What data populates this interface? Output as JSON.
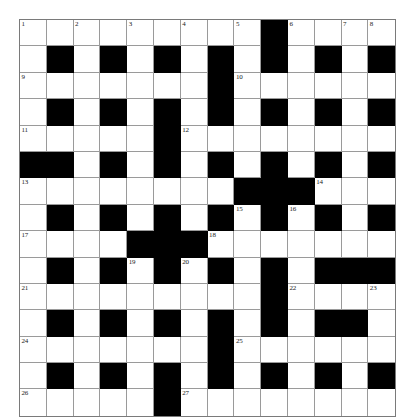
{
  "puzzle": {
    "type": "crossword-grid",
    "rows": 14,
    "cols": 14,
    "colors": {
      "block": "#000000",
      "cell": "#ffffff",
      "gridline": "#9a9a9a",
      "border": "#7a7a7a",
      "number": "#1a1a1a"
    },
    "legend": {
      "white": "open letter cell",
      "black": "blocked cell"
    },
    "clue_numbers_present": [
      1,
      2,
      3,
      4,
      5,
      6,
      7,
      8,
      9,
      10,
      11,
      12,
      13,
      14,
      15,
      16,
      17,
      18,
      19,
      20,
      21,
      22,
      23,
      24,
      25,
      26,
      27
    ],
    "grid": [
      [
        {
          "t": "w",
          "n": "1"
        },
        {
          "t": "w"
        },
        {
          "t": "w",
          "n": "2"
        },
        {
          "t": "w"
        },
        {
          "t": "w",
          "n": "3"
        },
        {
          "t": "w"
        },
        {
          "t": "w",
          "n": "4"
        },
        {
          "t": "w"
        },
        {
          "t": "w",
          "n": "5"
        },
        {
          "t": "b"
        },
        {
          "t": "w",
          "n": "6"
        },
        {
          "t": "w"
        },
        {
          "t": "w",
          "n": "7"
        },
        {
          "t": "w",
          "n": "8"
        }
      ],
      [
        {
          "t": "w"
        },
        {
          "t": "b"
        },
        {
          "t": "w"
        },
        {
          "t": "b"
        },
        {
          "t": "w"
        },
        {
          "t": "b"
        },
        {
          "t": "w"
        },
        {
          "t": "b"
        },
        {
          "t": "w"
        },
        {
          "t": "b"
        },
        {
          "t": "w"
        },
        {
          "t": "b"
        },
        {
          "t": "w"
        },
        {
          "t": "b"
        }
      ],
      [
        {
          "t": "w",
          "n": "9"
        },
        {
          "t": "w"
        },
        {
          "t": "w"
        },
        {
          "t": "w"
        },
        {
          "t": "w"
        },
        {
          "t": "w"
        },
        {
          "t": "w"
        },
        {
          "t": "b"
        },
        {
          "t": "w",
          "n": "10"
        },
        {
          "t": "w"
        },
        {
          "t": "w"
        },
        {
          "t": "w"
        },
        {
          "t": "w"
        },
        {
          "t": "w"
        }
      ],
      [
        {
          "t": "w"
        },
        {
          "t": "b"
        },
        {
          "t": "w"
        },
        {
          "t": "b"
        },
        {
          "t": "w"
        },
        {
          "t": "b"
        },
        {
          "t": "w"
        },
        {
          "t": "b"
        },
        {
          "t": "w"
        },
        {
          "t": "b"
        },
        {
          "t": "w"
        },
        {
          "t": "b"
        },
        {
          "t": "w"
        },
        {
          "t": "b"
        }
      ],
      [
        {
          "t": "w",
          "n": "11"
        },
        {
          "t": "w"
        },
        {
          "t": "w"
        },
        {
          "t": "w"
        },
        {
          "t": "w"
        },
        {
          "t": "b"
        },
        {
          "t": "w",
          "n": "12"
        },
        {
          "t": "w"
        },
        {
          "t": "w"
        },
        {
          "t": "w"
        },
        {
          "t": "w"
        },
        {
          "t": "w"
        },
        {
          "t": "w"
        },
        {
          "t": "w"
        }
      ],
      [
        {
          "t": "b"
        },
        {
          "t": "b"
        },
        {
          "t": "w"
        },
        {
          "t": "b"
        },
        {
          "t": "w"
        },
        {
          "t": "b"
        },
        {
          "t": "w"
        },
        {
          "t": "b"
        },
        {
          "t": "w"
        },
        {
          "t": "b"
        },
        {
          "t": "w"
        },
        {
          "t": "b"
        },
        {
          "t": "w"
        },
        {
          "t": "b"
        }
      ],
      [
        {
          "t": "w",
          "n": "13"
        },
        {
          "t": "w"
        },
        {
          "t": "w"
        },
        {
          "t": "w"
        },
        {
          "t": "w"
        },
        {
          "t": "w"
        },
        {
          "t": "w"
        },
        {
          "t": "w"
        },
        {
          "t": "b"
        },
        {
          "t": "b"
        },
        {
          "t": "b"
        },
        {
          "t": "w",
          "n": "14"
        },
        {
          "t": "w"
        },
        {
          "t": "w"
        }
      ],
      [
        {
          "t": "w"
        },
        {
          "t": "b"
        },
        {
          "t": "w"
        },
        {
          "t": "b"
        },
        {
          "t": "w"
        },
        {
          "t": "b"
        },
        {
          "t": "w"
        },
        {
          "t": "b"
        },
        {
          "t": "w",
          "n": "15"
        },
        {
          "t": "b"
        },
        {
          "t": "w",
          "n": "16"
        },
        {
          "t": "b"
        },
        {
          "t": "w"
        },
        {
          "t": "b"
        }
      ],
      [
        {
          "t": "w",
          "n": "17"
        },
        {
          "t": "w"
        },
        {
          "t": "w"
        },
        {
          "t": "w"
        },
        {
          "t": "b"
        },
        {
          "t": "b"
        },
        {
          "t": "b"
        },
        {
          "t": "w",
          "n": "18"
        },
        {
          "t": "w"
        },
        {
          "t": "w"
        },
        {
          "t": "w"
        },
        {
          "t": "w"
        },
        {
          "t": "w"
        },
        {
          "t": "w"
        }
      ],
      [
        {
          "t": "w"
        },
        {
          "t": "b"
        },
        {
          "t": "w"
        },
        {
          "t": "b"
        },
        {
          "t": "w",
          "n": "19"
        },
        {
          "t": "b"
        },
        {
          "t": "w",
          "n": "20"
        },
        {
          "t": "b"
        },
        {
          "t": "w"
        },
        {
          "t": "b"
        },
        {
          "t": "w"
        },
        {
          "t": "b"
        },
        {
          "t": "b"
        },
        {
          "t": "b"
        }
      ],
      [
        {
          "t": "w",
          "n": "21"
        },
        {
          "t": "w"
        },
        {
          "t": "w"
        },
        {
          "t": "w"
        },
        {
          "t": "w"
        },
        {
          "t": "w"
        },
        {
          "t": "w"
        },
        {
          "t": "w"
        },
        {
          "t": "w"
        },
        {
          "t": "b"
        },
        {
          "t": "w",
          "n": "22"
        },
        {
          "t": "w"
        },
        {
          "t": "w"
        },
        {
          "t": "w",
          "n": "23"
        }
      ],
      [
        {
          "t": "w"
        },
        {
          "t": "b"
        },
        {
          "t": "w"
        },
        {
          "t": "b"
        },
        {
          "t": "w"
        },
        {
          "t": "b"
        },
        {
          "t": "w"
        },
        {
          "t": "b"
        },
        {
          "t": "w"
        },
        {
          "t": "b"
        },
        {
          "t": "w"
        },
        {
          "t": "b"
        },
        {
          "t": "b"
        },
        {
          "t": "w"
        }
      ],
      [
        {
          "t": "w",
          "n": "24"
        },
        {
          "t": "w"
        },
        {
          "t": "w"
        },
        {
          "t": "w"
        },
        {
          "t": "w"
        },
        {
          "t": "w"
        },
        {
          "t": "w"
        },
        {
          "t": "b"
        },
        {
          "t": "w",
          "n": "25"
        },
        {
          "t": "w"
        },
        {
          "t": "w"
        },
        {
          "t": "w"
        },
        {
          "t": "w"
        },
        {
          "t": "w"
        }
      ],
      [
        {
          "t": "w"
        },
        {
          "t": "b"
        },
        {
          "t": "w"
        },
        {
          "t": "b"
        },
        {
          "t": "w"
        },
        {
          "t": "b"
        },
        {
          "t": "w"
        },
        {
          "t": "b"
        },
        {
          "t": "w"
        },
        {
          "t": "b"
        },
        {
          "t": "w"
        },
        {
          "t": "b"
        },
        {
          "t": "w"
        },
        {
          "t": "b"
        }
      ]
    ],
    "last_row": [
      {
        "t": "w",
        "n": "26"
      },
      {
        "t": "w"
      },
      {
        "t": "w"
      },
      {
        "t": "w"
      },
      {
        "t": "w"
      },
      {
        "t": "b"
      },
      {
        "t": "w",
        "n": "27"
      },
      {
        "t": "w"
      },
      {
        "t": "w"
      },
      {
        "t": "w"
      },
      {
        "t": "w"
      },
      {
        "t": "w"
      },
      {
        "t": "w"
      },
      {
        "t": "w"
      }
    ]
  }
}
